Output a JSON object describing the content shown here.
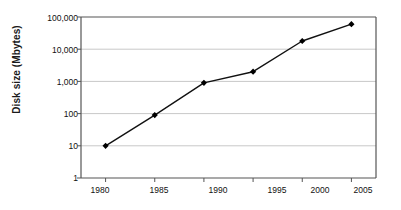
{
  "chart_data": {
    "type": "line",
    "title": "",
    "xlabel": "",
    "ylabel": "Disk size (Mbytes)",
    "x": [
      1980,
      1985,
      1990,
      1995,
      2000,
      2005
    ],
    "xticklabels": [
      "1980",
      "1985",
      "1990",
      "1995",
      "2000",
      "2005"
    ],
    "values": [
      10,
      90,
      900,
      2000,
      18000,
      60000
    ],
    "series": [
      {
        "name": "Disk size",
        "values": [
          10,
          90,
          900,
          2000,
          18000,
          60000
        ]
      }
    ],
    "yscale": "log",
    "ylim": [
      1,
      100000
    ],
    "yticks": [
      1,
      10,
      100,
      1000,
      10000,
      100000
    ],
    "yticklabels": [
      "1",
      "10",
      "100",
      "1,000",
      "10,000",
      "100,000"
    ],
    "xlim": [
      1977.5,
      2007.5
    ],
    "grid": "horizontal",
    "legend": "none",
    "marker": "diamond",
    "line_color": "#111111",
    "marker_color": "#000000",
    "grid_color": "#c8c8c8",
    "frame_color": "#555555",
    "background": "#ffffff"
  }
}
